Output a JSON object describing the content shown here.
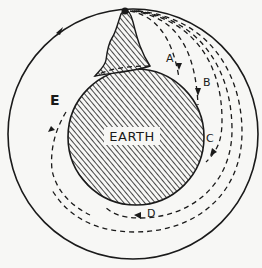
{
  "diagram": {
    "earth_label": "EARTH",
    "trajectory_labels": {
      "a": "A",
      "b": "B",
      "c": "C",
      "d": "D",
      "e": "E"
    },
    "elements": {
      "earth": "hatched circle",
      "mountain": "hatched peak on top of earth with cannon point at summit",
      "orbit": "solid outer circle with arrow (orbit)",
      "trajectories": "dashed curves A–E falling from summit around earth"
    },
    "colors": {
      "ink": "#1a1a1a",
      "paper": "#f7f7f5"
    }
  }
}
